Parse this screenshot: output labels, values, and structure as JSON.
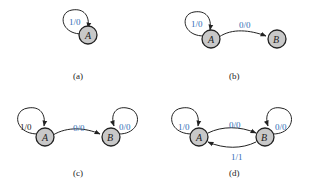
{
  "colors": {
    "label_blue": "#2f6db5",
    "node_fill": "#c8c8c8",
    "stroke": "#222222"
  },
  "panels": [
    {
      "caption": "(a)",
      "nodes": [
        {
          "name": "A"
        }
      ],
      "edges": [
        {
          "from": "A",
          "to": "A",
          "label": "1/0"
        }
      ]
    },
    {
      "caption": "(b)",
      "nodes": [
        {
          "name": "A"
        },
        {
          "name": "B"
        }
      ],
      "edges": [
        {
          "from": "A",
          "to": "A",
          "label": "1/0"
        },
        {
          "from": "A",
          "to": "B",
          "label": "0/0"
        }
      ]
    },
    {
      "caption": "(c)",
      "nodes": [
        {
          "name": "A"
        },
        {
          "name": "B"
        }
      ],
      "edges": [
        {
          "from": "A",
          "to": "A",
          "label": "1/0"
        },
        {
          "from": "A",
          "to": "B",
          "label": "0/0"
        },
        {
          "from": "B",
          "to": "B",
          "label": "0/0"
        }
      ]
    },
    {
      "caption": "(d)",
      "nodes": [
        {
          "name": "A"
        },
        {
          "name": "B"
        }
      ],
      "edges": [
        {
          "from": "A",
          "to": "A",
          "label": "1/0"
        },
        {
          "from": "A",
          "to": "B",
          "label": "0/0"
        },
        {
          "from": "B",
          "to": "B",
          "label": "0/0"
        },
        {
          "from": "B",
          "to": "A",
          "label": "1/1"
        }
      ]
    }
  ]
}
